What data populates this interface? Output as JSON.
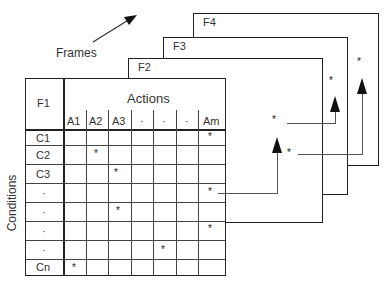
{
  "labels": {
    "frames": "Frames",
    "conditions": "Conditions",
    "actions": "Actions",
    "corner": "F1"
  },
  "frames": [
    {
      "id": "F4",
      "label": "F4"
    },
    {
      "id": "F3",
      "label": "F3"
    },
    {
      "id": "F2",
      "label": "F2"
    }
  ],
  "columns": [
    "A1",
    "A2",
    "A3",
    "·",
    "·",
    "·",
    "Am"
  ],
  "rows": [
    "C1",
    "C2",
    "C3",
    "·",
    "·",
    "·",
    "·",
    "Cn"
  ],
  "marks": [
    {
      "row": 0,
      "col": 6
    },
    {
      "row": 1,
      "col": 1
    },
    {
      "row": 2,
      "col": 2
    },
    {
      "row": 3,
      "col": 6
    },
    {
      "row": 4,
      "col": 2
    },
    {
      "row": 5,
      "col": 6
    },
    {
      "row": 6,
      "col": 4
    },
    {
      "row": 7,
      "col": 0
    }
  ],
  "mark_symbol": "*",
  "links": [
    {
      "from": "F1 row 4 Am",
      "to": "F2"
    },
    {
      "from": "F2",
      "to": "F3"
    },
    {
      "from": "F2",
      "to": "F4"
    }
  ]
}
